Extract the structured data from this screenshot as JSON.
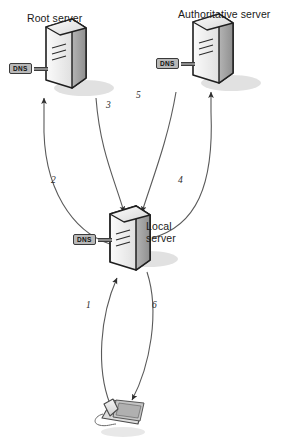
{
  "diagram": {
    "type": "network-flow-diagram",
    "background": "#ffffff"
  },
  "nodes": [
    {
      "id": "root-server",
      "label": "Root server",
      "badge": "DNS",
      "kind": "server-tower",
      "x": 60,
      "y": 68
    },
    {
      "id": "authoritative-server",
      "label": "Authoritative server",
      "badge": "DNS",
      "kind": "server-tower",
      "x": 207,
      "y": 63
    },
    {
      "id": "local-server",
      "label": "Local\nserver",
      "label_line1": "Local",
      "label_line2": "server",
      "badge": "DNS",
      "kind": "server-tower",
      "x": 124,
      "y": 239
    },
    {
      "id": "client-phone",
      "label": "",
      "kind": "ip-phone",
      "x": 115,
      "y": 414
    }
  ],
  "steps": [
    {
      "n": "1",
      "from": "client-phone",
      "to": "local-server",
      "label": "1"
    },
    {
      "n": "2",
      "from": "local-server",
      "to": "root-server",
      "label": "2"
    },
    {
      "n": "3",
      "from": "root-server",
      "to": "local-server",
      "label": "3"
    },
    {
      "n": "4",
      "from": "local-server",
      "to": "authoritative-server",
      "label": "4"
    },
    {
      "n": "5",
      "from": "authoritative-server",
      "to": "local-server",
      "label": "5"
    },
    {
      "n": "6",
      "from": "local-server",
      "to": "client-phone",
      "label": "6"
    }
  ],
  "colors": {
    "stroke": "#4a4a4a",
    "server_face_light": "#f2f2f2",
    "server_face_mid": "#cfcfcf",
    "server_face_dark": "#9a9a9a",
    "badge_fill": "#b8b8b8",
    "shadow": "#d8d8d8",
    "text": "#1a1a1a"
  }
}
